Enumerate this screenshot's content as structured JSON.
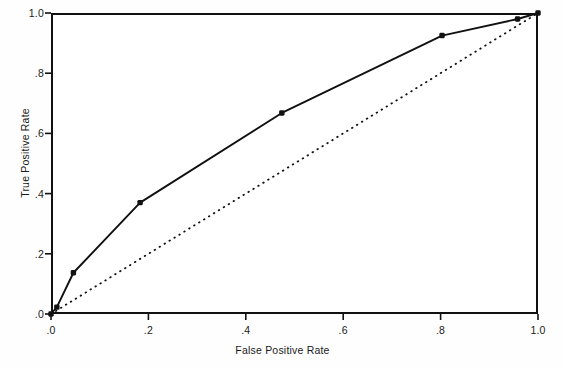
{
  "figure": {
    "title": "",
    "background_color": "#ffffff",
    "line_color": "#111111",
    "marker_color": "#111111"
  },
  "chart_data": {
    "type": "line",
    "title": "",
    "subtitle": "",
    "xlabel": "False Positive Rate",
    "ylabel": "True Positive Rate",
    "xlim": [
      0.0,
      1.0
    ],
    "ylim": [
      0.0,
      1.0
    ],
    "grid": false,
    "legend_position": "none",
    "xticks": [
      0.0,
      0.2,
      0.4,
      0.6,
      0.8,
      1.0
    ],
    "xtick_labels": [
      ".0",
      ".2",
      ".4",
      ".6",
      ".8",
      "1.0"
    ],
    "yticks": [
      0.0,
      0.2,
      0.4,
      0.6,
      0.8,
      1.0
    ],
    "ytick_labels": [
      ".0",
      ".2",
      ".4",
      ".6",
      ".8",
      "1.0"
    ],
    "series": [
      {
        "name": "ROC curve",
        "style": "solid",
        "marker": "filled-square",
        "color": "#111111",
        "x": [
          0.0,
          0.012,
          0.046,
          0.183,
          0.474,
          0.803,
          0.958,
          1.0
        ],
        "y": [
          0.0,
          0.023,
          0.137,
          0.37,
          0.668,
          0.925,
          0.98,
          1.0
        ]
      },
      {
        "name": "Reference line",
        "style": "dotted",
        "marker": "none",
        "color": "#111111",
        "x": [
          0.0,
          1.0
        ],
        "y": [
          0.0,
          1.0
        ]
      }
    ]
  }
}
